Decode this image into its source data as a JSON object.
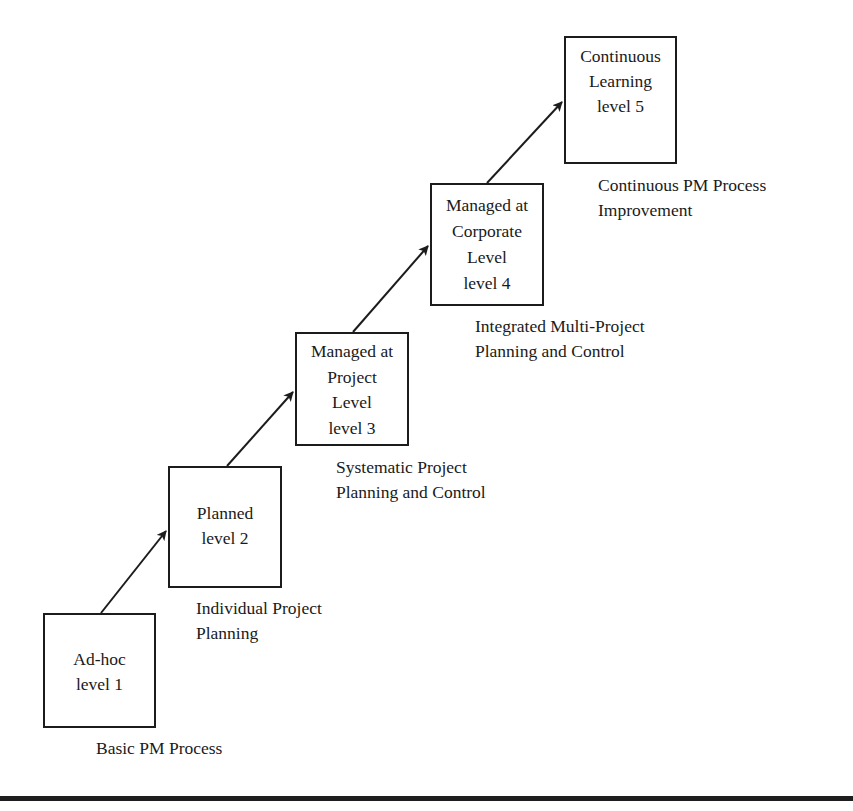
{
  "diagram": {
    "type": "staircase maturity model",
    "levels": [
      {
        "id": "level-1",
        "box_lines": [
          "Ad-hoc",
          "level 1"
        ],
        "caption_lines": [
          "Basic PM Process"
        ]
      },
      {
        "id": "level-2",
        "box_lines": [
          "Planned",
          "level 2"
        ],
        "caption_lines": [
          "Individual Project",
          "Planning"
        ]
      },
      {
        "id": "level-3",
        "box_lines": [
          "Managed at",
          "Project",
          "Level",
          "level 3"
        ],
        "caption_lines": [
          "Systematic Project",
          "Planning and Control"
        ]
      },
      {
        "id": "level-4",
        "box_lines": [
          "Managed at",
          "Corporate",
          "Level",
          "level 4"
        ],
        "caption_lines": [
          "Integrated Multi-Project",
          "Planning and Control"
        ]
      },
      {
        "id": "level-5",
        "box_lines": [
          "Continuous",
          "Learning",
          "level 5"
        ],
        "caption_lines": [
          "Continuous PM Process",
          "Improvement"
        ]
      }
    ],
    "arrows": [
      {
        "from": "level-1",
        "to": "level-2"
      },
      {
        "from": "level-2",
        "to": "level-3"
      },
      {
        "from": "level-3",
        "to": "level-4"
      },
      {
        "from": "level-4",
        "to": "level-5"
      }
    ],
    "colors": {
      "stroke": "#1c1c1c",
      "background": "#ffffff",
      "text": "#1a1a1a"
    }
  }
}
